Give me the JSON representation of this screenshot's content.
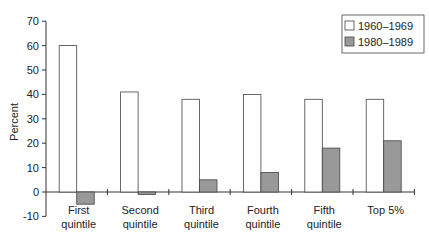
{
  "chart_data": {
    "type": "bar",
    "title": "",
    "xlabel": "",
    "ylabel": "Percent",
    "ylim": [
      -10,
      70
    ],
    "yticks": [
      -10,
      0,
      10,
      20,
      30,
      40,
      50,
      60,
      70
    ],
    "grid": false,
    "legend_position": "top-right",
    "categories": [
      [
        "First",
        "quintile"
      ],
      [
        "Second",
        "quintile"
      ],
      [
        "Third",
        "quintile"
      ],
      [
        "Fourth",
        "quintile"
      ],
      [
        "Fifth",
        "quintile"
      ],
      [
        "Top 5%"
      ]
    ],
    "series": [
      {
        "name": "1960–1969",
        "color": "#ffffff",
        "values": [
          60,
          41,
          38,
          40,
          38,
          38
        ]
      },
      {
        "name": "1980–1989",
        "color": "#999999",
        "values": [
          -5,
          -1,
          5,
          8,
          18,
          21
        ]
      }
    ]
  },
  "colors": {
    "axis": "#333333",
    "bar_outline": "#444444"
  }
}
